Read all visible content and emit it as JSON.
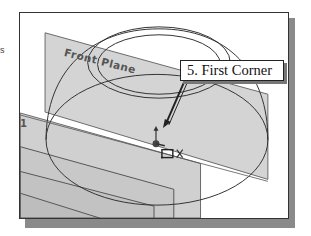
{
  "figure": {
    "left_edge_char": "s",
    "callout": {
      "text": "5. First Corner"
    },
    "viewport": {
      "plane_label": "Front Plane",
      "side_plane_label": "1",
      "icons": [
        "origin-triad-icon",
        "rectangle-cursor-icon",
        "snap-x-icon",
        "callout-arrow-icon"
      ]
    },
    "colors": {
      "plane_fill": "#d2d2d2",
      "plane_edge": "#666666",
      "sketch_line": "#333333",
      "frame_border": "#333333",
      "shadow": "#8a8a8a",
      "background": "#ffffff"
    }
  }
}
